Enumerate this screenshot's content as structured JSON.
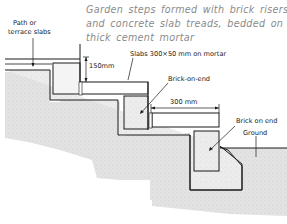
{
  "caption": {
    "lines": [
      "Garden steps formed with brick risers",
      "and concrete slab treads, bedded on",
      "thick cement mortar"
    ]
  },
  "labels": {
    "path_slabs_line1": "Path or",
    "path_slabs_line2": "terrace slabs",
    "riser_height": "150mm",
    "slabs_spec": "Slabs  300×50 mm on mortar",
    "brick_on_end_upper": "Brick-on-end",
    "tread_depth": "300 mm",
    "brick_on_end_lower": "Brick on end",
    "ground": "Ground"
  },
  "colors": {
    "line": "#1a1a1a",
    "caption": "#8a8a8a",
    "earth_fill": "#dcdcdc",
    "concrete_fill": "#e9e9e9",
    "brick_fill": "#e2e2e2"
  }
}
